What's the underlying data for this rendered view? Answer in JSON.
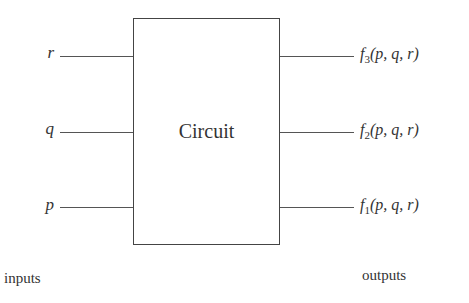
{
  "diagram": {
    "box_label": "Circuit",
    "inputs": [
      {
        "label": "r"
      },
      {
        "label": "q"
      },
      {
        "label": "p"
      }
    ],
    "outputs": [
      {
        "func": "f",
        "sub": "3",
        "args": "(p, q, r)"
      },
      {
        "func": "f",
        "sub": "2",
        "args": "(p, q, r)"
      },
      {
        "func": "f",
        "sub": "1",
        "args": "(p, q, r)"
      }
    ],
    "inputs_caption": "inputs",
    "outputs_caption": "outputs"
  }
}
